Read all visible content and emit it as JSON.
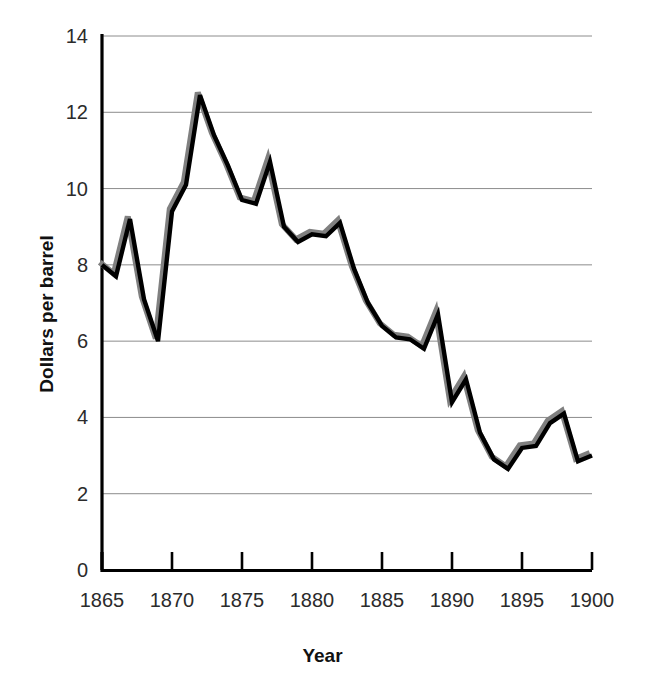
{
  "chart_data": {
    "type": "line",
    "title": "",
    "xlabel": "Year",
    "ylabel": "Dollars per barrel",
    "xlim": [
      1865,
      1900
    ],
    "ylim": [
      0,
      14
    ],
    "grid": true,
    "legend": false,
    "x_tick_labels": [
      "1865",
      "1870",
      "1875",
      "1880",
      "1885",
      "1890",
      "1895",
      "1900"
    ],
    "x_ticks": [
      1865,
      1870,
      1875,
      1880,
      1885,
      1890,
      1895,
      1900
    ],
    "y_tick_labels": [
      "0",
      "2",
      "4",
      "6",
      "8",
      "10",
      "12",
      "14"
    ],
    "y_ticks": [
      0,
      2,
      4,
      6,
      8,
      10,
      12,
      14
    ],
    "line_color": "#000000",
    "shadow_color": "#808080",
    "gridline_color": "#8c8c8c",
    "axis_color": "#000000",
    "x": [
      1865,
      1866,
      1867,
      1868,
      1869,
      1870,
      1871,
      1872,
      1873,
      1874,
      1875,
      1876,
      1877,
      1878,
      1879,
      1880,
      1881,
      1882,
      1883,
      1884,
      1885,
      1886,
      1887,
      1888,
      1889,
      1890,
      1891,
      1892,
      1893,
      1894,
      1895,
      1896,
      1897,
      1898,
      1899,
      1900
    ],
    "values": [
      8.0,
      7.7,
      9.2,
      7.1,
      6.0,
      9.4,
      10.1,
      12.45,
      11.4,
      10.6,
      9.7,
      9.6,
      10.7,
      9.0,
      8.6,
      8.8,
      8.75,
      9.1,
      7.9,
      7.0,
      6.4,
      6.1,
      6.05,
      5.8,
      6.7,
      4.4,
      5.0,
      3.6,
      2.9,
      2.65,
      3.2,
      3.25,
      3.85,
      4.1,
      2.85,
      3.0
    ]
  }
}
